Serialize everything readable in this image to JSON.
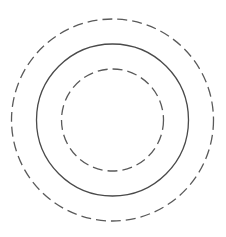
{
  "diagram": {
    "type": "concentric-circles",
    "center": [
      112.5,
      120
    ],
    "circles": [
      {
        "name": "outer",
        "radius": 101,
        "style": "dashed",
        "stroke": "#5a5a5a"
      },
      {
        "name": "middle",
        "radius": 76,
        "style": "solid",
        "stroke": "#4a4a4a"
      },
      {
        "name": "inner",
        "radius": 51,
        "style": "dashed",
        "stroke": "#5a5a5a"
      }
    ],
    "dash_pattern": "10 5"
  }
}
